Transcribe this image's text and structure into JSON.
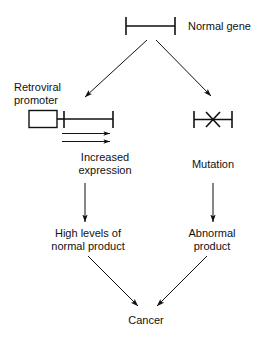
{
  "figure": {
    "background_color": "#ffffff",
    "ink_color": "#111111",
    "width": 264,
    "height": 339
  },
  "labels": {
    "normal_gene": "Normal gene",
    "retroviral_promoter_line1": "Retroviral",
    "retroviral_promoter_line2": "promoter",
    "increased_expression_line1": "Increased",
    "increased_expression_line2": "expression",
    "mutation": "Mutation",
    "high_levels_line1": "High levels of",
    "high_levels_line2": "normal product",
    "abnormal_product_line1": "Abnormal",
    "abnormal_product_line2": "product",
    "cancer": "Cancer"
  },
  "nodes": [
    {
      "id": "normal-gene",
      "label": "Normal gene",
      "type": "gene-bar",
      "x": 150,
      "y": 26
    },
    {
      "id": "retroviral-insertion-gene",
      "label": "Retroviral promoter",
      "type": "gene-bar-with-promoter-box",
      "x": 71,
      "y": 119
    },
    {
      "id": "mutated-gene",
      "label": "Mutation",
      "type": "gene-bar-with-x",
      "x": 213,
      "y": 119
    },
    {
      "id": "increased-expression",
      "label": "Increased expression",
      "type": "text",
      "x": 105,
      "y": 164
    },
    {
      "id": "high-levels-normal-product",
      "label": "High levels of normal product",
      "type": "text",
      "x": 88,
      "y": 236
    },
    {
      "id": "abnormal-product",
      "label": "Abnormal product",
      "type": "text",
      "x": 212,
      "y": 236
    },
    {
      "id": "cancer",
      "label": "Cancer",
      "type": "text",
      "x": 146,
      "y": 319
    }
  ],
  "edges": [
    {
      "id": "normal-gene-to-retroviral",
      "from": "normal-gene",
      "to": "retroviral-insertion-gene",
      "style": "arrow"
    },
    {
      "id": "normal-gene-to-mutation",
      "from": "normal-gene",
      "to": "mutated-gene",
      "style": "arrow"
    },
    {
      "id": "transcription-arrow-1",
      "from": "promoter",
      "to": "gene-end",
      "style": "arrow"
    },
    {
      "id": "transcription-arrow-2",
      "from": "promoter",
      "to": "gene-end",
      "style": "arrow"
    },
    {
      "id": "increased-expression-to-product",
      "from": "increased-expression",
      "to": "high-levels-normal-product",
      "style": "arrow"
    },
    {
      "id": "mutation-to-abnormal",
      "from": "mutation",
      "to": "abnormal-product",
      "style": "arrow"
    },
    {
      "id": "high-levels-to-cancer",
      "from": "high-levels-normal-product",
      "to": "cancer",
      "style": "arrow"
    },
    {
      "id": "abnormal-to-cancer",
      "from": "abnormal-product",
      "to": "cancer",
      "style": "arrow"
    }
  ]
}
